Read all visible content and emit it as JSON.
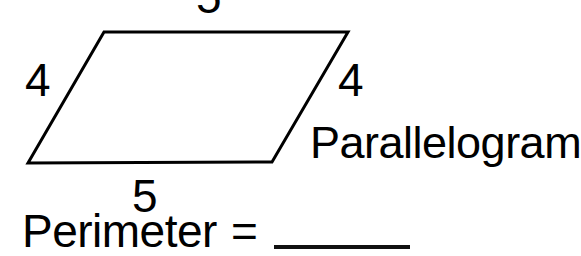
{
  "worksheet": {
    "background_color": "#ffffff",
    "ink_color": "#000000"
  },
  "figure": {
    "name": "parallelogram",
    "shape_label": "Parallelogram",
    "stroke_color": "#000000",
    "stroke_width": 3,
    "fill": "none",
    "vertices": {
      "top_left": [
        104,
        32
      ],
      "top_right": [
        348,
        32
      ],
      "bottom_right": [
        272,
        162
      ],
      "bottom_left": [
        28,
        163
      ]
    },
    "side_labels": {
      "top": "5",
      "left": "4",
      "right": "4",
      "bottom": "5"
    }
  },
  "problem": {
    "prompt_label": "Perimeter",
    "equals_sign": "=",
    "answer_value": "",
    "answer_blank": "______"
  }
}
